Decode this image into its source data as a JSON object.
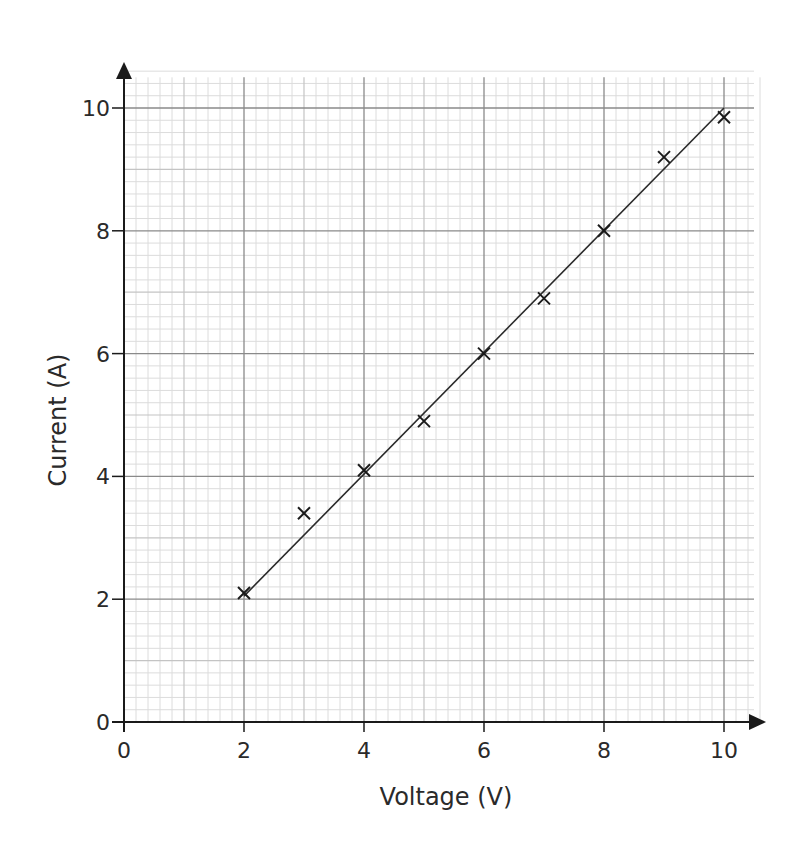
{
  "chart_data": {
    "type": "scatter",
    "title": "",
    "xlabel": "Voltage (V)",
    "ylabel": "Current (A)",
    "xlim": [
      0,
      10.5
    ],
    "ylim": [
      0,
      10.5
    ],
    "x_ticks": [
      0,
      2,
      4,
      6,
      8,
      10
    ],
    "y_ticks": [
      0,
      2,
      4,
      6,
      8,
      10
    ],
    "x_tick_labels": [
      "0",
      "2",
      "4",
      "6",
      "8",
      "10"
    ],
    "y_tick_labels": [
      "0",
      "2",
      "4",
      "6",
      "8",
      "10"
    ],
    "grid": true,
    "grid_minor_step": 0.2,
    "grid_major_step": 2,
    "legend": null,
    "series": [
      {
        "name": "measurements",
        "marker": "x",
        "x": [
          2,
          3,
          4,
          5,
          6,
          7,
          8,
          9,
          10
        ],
        "y": [
          2.1,
          3.4,
          4.1,
          4.9,
          6.0,
          6.9,
          8.0,
          9.2,
          9.85
        ]
      }
    ],
    "line_of_best_fit": {
      "x": [
        2,
        10
      ],
      "y": [
        2.05,
        10.0
      ]
    }
  },
  "colors": {
    "axis": "#1a1a1a",
    "grid_fine": "#dcdcdc",
    "grid_unit": "#c4c4c4",
    "grid_major": "#8a8a8a",
    "marker": "#1a1a1a",
    "fit_line": "#2a2a2a"
  }
}
